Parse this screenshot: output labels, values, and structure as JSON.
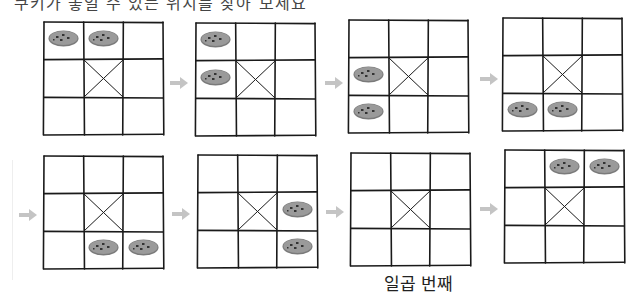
{
  "header": {
    "text": "쿠키가 놓일 수 있는 위치를 찾아 보세요"
  },
  "caption": {
    "text": "일곱 번째",
    "under_grid_index": 6
  },
  "colors": {
    "grid_line": "#1a1a1a",
    "cookie_fill": "#9a9a9a",
    "cookie_rim": "#7a7a7a",
    "cookie_spot": "#333333",
    "arrow": "#c4c4c4"
  },
  "grid_spec": {
    "rows": 3,
    "cols": 3,
    "center_cell_crossed": true
  },
  "grids": [
    {
      "index": 1,
      "x": 44,
      "y": 22,
      "cookies": [
        [
          0,
          0
        ],
        [
          0,
          1
        ]
      ]
    },
    {
      "index": 2,
      "x": 196,
      "y": 23,
      "cookies": [
        [
          0,
          0
        ],
        [
          1,
          0
        ]
      ]
    },
    {
      "index": 3,
      "x": 349,
      "y": 20,
      "cookies": [
        [
          1,
          0
        ],
        [
          2,
          0
        ]
      ]
    },
    {
      "index": 4,
      "x": 503,
      "y": 18,
      "cookies": [
        [
          2,
          0
        ],
        [
          2,
          1
        ]
      ]
    },
    {
      "index": 5,
      "x": 44,
      "y": 156,
      "cookies": [
        [
          2,
          1
        ],
        [
          2,
          2
        ]
      ]
    },
    {
      "index": 6,
      "x": 198,
      "y": 155,
      "cookies": [
        [
          1,
          2
        ],
        [
          2,
          2
        ]
      ]
    },
    {
      "index": 7,
      "x": 351,
      "y": 153,
      "cookies": []
    },
    {
      "index": 8,
      "x": 505,
      "y": 150,
      "cookies": [
        [
          0,
          1
        ],
        [
          0,
          2
        ]
      ]
    }
  ],
  "arrows": [
    {
      "x": 170,
      "y": 74
    },
    {
      "x": 325,
      "y": 74
    },
    {
      "x": 480,
      "y": 70
    },
    {
      "x": 19,
      "y": 206
    },
    {
      "x": 172,
      "y": 205
    },
    {
      "x": 326,
      "y": 203
    },
    {
      "x": 480,
      "y": 200
    }
  ]
}
